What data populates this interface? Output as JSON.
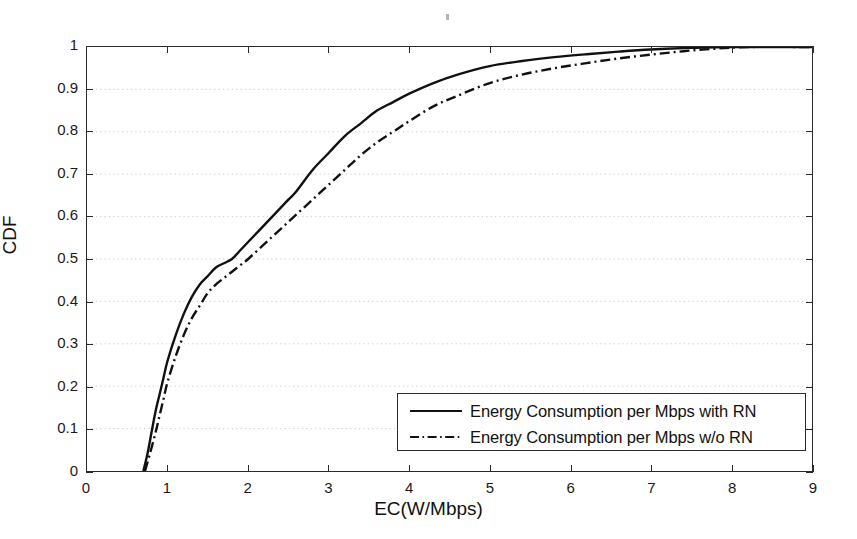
{
  "figure": {
    "background": "#ffffff",
    "axis_color": "#2b2b2b",
    "grid_color": "#c9c9c9",
    "series_color": "#111111"
  },
  "axes": {
    "xlabel": "EC(W/Mbps)",
    "ylabel": "CDF",
    "xticks": [
      "0",
      "1",
      "2",
      "3",
      "4",
      "5",
      "6",
      "7",
      "8",
      "9"
    ],
    "yticks": [
      "0",
      "0.1",
      "0.2",
      "0.3",
      "0.4",
      "0.5",
      "0.6",
      "0.7",
      "0.8",
      "0.9",
      "1"
    ]
  },
  "legend": {
    "position": "lower-right",
    "entries": [
      {
        "label": "Energy Consumption per Mbps with RN",
        "style": "solid"
      },
      {
        "label": "Energy Consumption per Mbps w/o RN",
        "style": "dash-dot"
      }
    ]
  },
  "chart_data": {
    "type": "line",
    "title": "",
    "subtitle": "",
    "xlabel": "EC(W/Mbps)",
    "ylabel": "CDF",
    "xlim": [
      0,
      9
    ],
    "ylim": [
      0,
      1
    ],
    "xticks": [
      0,
      1,
      2,
      3,
      4,
      5,
      6,
      7,
      8,
      9
    ],
    "yticks": [
      0,
      0.1,
      0.2,
      0.3,
      0.4,
      0.5,
      0.6,
      0.7,
      0.8,
      0.9,
      1
    ],
    "grid": "horizontal-dotted",
    "legend_position": "lower right",
    "series": [
      {
        "name": "Energy Consumption per Mbps with RN",
        "style": "solid",
        "color": "#111111",
        "x": [
          0.7,
          0.75,
          0.8,
          0.85,
          0.9,
          0.95,
          1.0,
          1.1,
          1.2,
          1.3,
          1.4,
          1.5,
          1.6,
          1.7,
          1.8,
          1.9,
          2.0,
          2.2,
          2.4,
          2.5,
          2.6,
          2.8,
          3.0,
          3.2,
          3.4,
          3.6,
          3.8,
          4.0,
          4.3,
          4.6,
          5.0,
          5.4,
          5.8,
          6.2,
          6.6,
          7.0,
          7.5,
          8.0,
          9.0
        ],
        "y": [
          0.0,
          0.04,
          0.09,
          0.14,
          0.18,
          0.22,
          0.26,
          0.32,
          0.37,
          0.41,
          0.44,
          0.46,
          0.48,
          0.49,
          0.5,
          0.52,
          0.54,
          0.58,
          0.62,
          0.64,
          0.66,
          0.71,
          0.75,
          0.79,
          0.82,
          0.85,
          0.87,
          0.89,
          0.915,
          0.935,
          0.955,
          0.967,
          0.976,
          0.983,
          0.989,
          0.994,
          0.998,
          1.0,
          1.0
        ]
      },
      {
        "name": "Energy Consumption per Mbps w/o RN",
        "style": "dash-dot",
        "color": "#111111",
        "x": [
          0.72,
          0.78,
          0.85,
          0.9,
          0.95,
          1.0,
          1.1,
          1.2,
          1.3,
          1.4,
          1.5,
          1.6,
          1.7,
          1.8,
          1.9,
          2.0,
          2.2,
          2.4,
          2.6,
          2.8,
          3.0,
          3.2,
          3.4,
          3.6,
          3.8,
          4.0,
          4.3,
          4.6,
          5.0,
          5.4,
          5.8,
          6.2,
          6.6,
          7.0,
          7.4,
          7.8,
          8.2,
          9.0
        ],
        "y": [
          0.0,
          0.04,
          0.09,
          0.13,
          0.17,
          0.21,
          0.27,
          0.32,
          0.36,
          0.39,
          0.42,
          0.44,
          0.455,
          0.47,
          0.485,
          0.5,
          0.535,
          0.57,
          0.605,
          0.64,
          0.675,
          0.71,
          0.745,
          0.775,
          0.8,
          0.825,
          0.86,
          0.885,
          0.915,
          0.935,
          0.95,
          0.962,
          0.973,
          0.982,
          0.99,
          0.996,
          1.0,
          1.0
        ]
      }
    ]
  }
}
